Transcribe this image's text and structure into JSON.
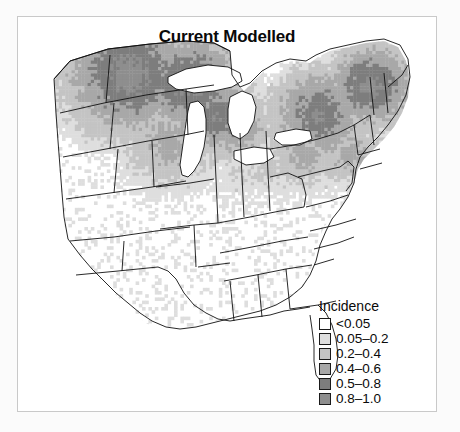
{
  "figure": {
    "title": "Current Modelled",
    "background_color": "#fbfbfb",
    "panel_color": "#ffffff",
    "border_color": "#c9c9c9"
  },
  "legend": {
    "title": "Incidence",
    "position": "bottom-right",
    "entries": [
      {
        "label": "<0.05",
        "color": "#ffffff"
      },
      {
        "label": "0.05–0.2",
        "color": "#dedede"
      },
      {
        "label": "0.2–0.4",
        "color": "#c4c4c4"
      },
      {
        "label": "0.4–0.6",
        "color": "#a8a8a8"
      },
      {
        "label": "0.5–0.8",
        "color": "#7d7d7d"
      },
      {
        "label": "0.8–1.0",
        "color": "#8e8e8e"
      }
    ]
  },
  "chart_data": {
    "type": "heatmap",
    "title": "Current Modelled",
    "subtitle": "",
    "xlabel": "",
    "ylabel": "",
    "grid": false,
    "legend_position": "bottom-right",
    "value_name": "Incidence",
    "value_range": [
      0,
      1
    ],
    "class_breaks": [
      0.05,
      0.2,
      0.4,
      0.6,
      0.8,
      1.0
    ],
    "class_labels": [
      "<0.05",
      "0.05–0.2",
      "0.2–0.4",
      "0.4–0.6",
      "0.5–0.8",
      "0.8–1.0"
    ],
    "class_colors": [
      "#ffffff",
      "#dedede",
      "#c4c4c4",
      "#a8a8a8",
      "#7d7d7d",
      "#8e8e8e"
    ],
    "region": "Central and Eastern United States",
    "annotations": [
      "High incidence (0.5-1.0) across the Upper Midwest: North Dakota, South Dakota, Minnesota, Wisconsin",
      "High incidence (0.5-1.0) across the Northeast: New England, New York, Pennsylvania",
      "Gradient fading to <0.05 southward through Nebraska, Kansas, Missouri and the Ohio Valley",
      "Southern states including Texas, Louisiana, Mississippi, Alabama, Georgia and Florida show <0.05",
      "Great Lakes shown as unshaded water bodies"
    ],
    "states": [
      {
        "name": "Montana",
        "abbr": "MT",
        "incidence": 0.85,
        "class": 5
      },
      {
        "name": "North Dakota",
        "abbr": "ND",
        "incidence": 0.88,
        "class": 5
      },
      {
        "name": "Minnesota",
        "abbr": "MN",
        "incidence": 0.82,
        "class": 5
      },
      {
        "name": "Wisconsin",
        "abbr": "WI",
        "incidence": 0.86,
        "class": 5
      },
      {
        "name": "Michigan",
        "abbr": "MI",
        "incidence": 0.78,
        "class": 5
      },
      {
        "name": "Wyoming",
        "abbr": "WY",
        "incidence": 0.72,
        "class": 4
      },
      {
        "name": "South Dakota",
        "abbr": "SD",
        "incidence": 0.75,
        "class": 4
      },
      {
        "name": "Iowa",
        "abbr": "IA",
        "incidence": 0.45,
        "class": 3
      },
      {
        "name": "Nebraska",
        "abbr": "NE",
        "incidence": 0.18,
        "class": 1
      },
      {
        "name": "Colorado",
        "abbr": "CO",
        "incidence": 0.04,
        "class": 0
      },
      {
        "name": "Kansas",
        "abbr": "KS",
        "incidence": 0.03,
        "class": 0
      },
      {
        "name": "Missouri",
        "abbr": "MO",
        "incidence": 0.12,
        "class": 1
      },
      {
        "name": "Illinois",
        "abbr": "IL",
        "incidence": 0.35,
        "class": 2
      },
      {
        "name": "Indiana",
        "abbr": "IN",
        "incidence": 0.4,
        "class": 3
      },
      {
        "name": "Ohio",
        "abbr": "OH",
        "incidence": 0.55,
        "class": 4
      },
      {
        "name": "Kentucky",
        "abbr": "KY",
        "incidence": 0.1,
        "class": 1
      },
      {
        "name": "Tennessee",
        "abbr": "TN",
        "incidence": 0.03,
        "class": 0
      },
      {
        "name": "West Virginia",
        "abbr": "WV",
        "incidence": 0.6,
        "class": 4
      },
      {
        "name": "Pennsylvania",
        "abbr": "PA",
        "incidence": 0.8,
        "class": 5
      },
      {
        "name": "New York",
        "abbr": "NY",
        "incidence": 0.84,
        "class": 5
      },
      {
        "name": "Vermont",
        "abbr": "VT",
        "incidence": 0.88,
        "class": 5
      },
      {
        "name": "New Hampshire",
        "abbr": "NH",
        "incidence": 0.86,
        "class": 5
      },
      {
        "name": "Maine",
        "abbr": "ME",
        "incidence": 0.83,
        "class": 5
      },
      {
        "name": "Massachusetts",
        "abbr": "MA",
        "incidence": 0.8,
        "class": 5
      },
      {
        "name": "Connecticut",
        "abbr": "CT",
        "incidence": 0.78,
        "class": 5
      },
      {
        "name": "Rhode Island",
        "abbr": "RI",
        "incidence": 0.76,
        "class": 5
      },
      {
        "name": "New Jersey",
        "abbr": "NJ",
        "incidence": 0.7,
        "class": 4
      },
      {
        "name": "Maryland",
        "abbr": "MD",
        "incidence": 0.45,
        "class": 3
      },
      {
        "name": "Delaware",
        "abbr": "DE",
        "incidence": 0.5,
        "class": 3
      },
      {
        "name": "Virginia",
        "abbr": "VA",
        "incidence": 0.2,
        "class": 1
      },
      {
        "name": "North Carolina",
        "abbr": "NC",
        "incidence": 0.04,
        "class": 0
      },
      {
        "name": "South Carolina",
        "abbr": "SC",
        "incidence": 0.02,
        "class": 0
      },
      {
        "name": "Georgia",
        "abbr": "GA",
        "incidence": 0.02,
        "class": 0
      },
      {
        "name": "Florida",
        "abbr": "FL",
        "incidence": 0.01,
        "class": 0
      },
      {
        "name": "Alabama",
        "abbr": "AL",
        "incidence": 0.02,
        "class": 0
      },
      {
        "name": "Mississippi",
        "abbr": "MS",
        "incidence": 0.02,
        "class": 0
      },
      {
        "name": "Arkansas",
        "abbr": "AR",
        "incidence": 0.03,
        "class": 0
      },
      {
        "name": "Louisiana",
        "abbr": "LA",
        "incidence": 0.01,
        "class": 0
      },
      {
        "name": "Oklahoma",
        "abbr": "OK",
        "incidence": 0.02,
        "class": 0
      },
      {
        "name": "Texas",
        "abbr": "TX",
        "incidence": 0.01,
        "class": 0
      }
    ]
  }
}
